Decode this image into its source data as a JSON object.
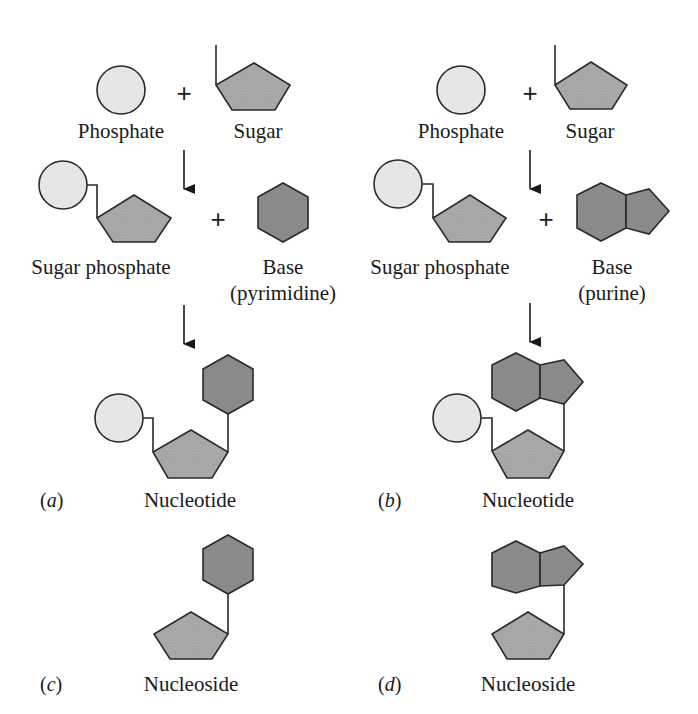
{
  "colors": {
    "phosphate_fill": "#e6e6e6",
    "sugar_fill": "#a9a9a9",
    "base_fill": "#8c8c8c",
    "stroke": "#2a2a2a"
  },
  "symbols": {
    "plus": "+"
  },
  "panels": {
    "a": {
      "tag_open": "(",
      "tag_letter": "a",
      "tag_close": ")",
      "reactant_1": "Phosphate",
      "reactant_2": "Sugar",
      "intermediate": "Sugar phosphate",
      "base_label": "Base",
      "base_type": "(pyrimidine)",
      "product": "Nucleotide"
    },
    "b": {
      "tag_open": "(",
      "tag_letter": "b",
      "tag_close": ")",
      "reactant_1": "Phosphate",
      "reactant_2": "Sugar",
      "intermediate": "Sugar phosphate",
      "base_label": "Base",
      "base_type": "(purine)",
      "product": "Nucleotide"
    },
    "c": {
      "tag_open": "(",
      "tag_letter": "c",
      "tag_close": ")",
      "product": "Nucleoside"
    },
    "d": {
      "tag_open": "(",
      "tag_letter": "d",
      "tag_close": ")",
      "product": "Nucleoside"
    }
  }
}
